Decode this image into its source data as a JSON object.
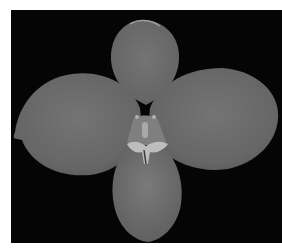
{
  "image": {
    "subject": "orchid flower",
    "style": "grayscale photograph",
    "background_color": "#050505",
    "border_color": "#ffffff",
    "petal_color": "#6b6b6b",
    "petal_highlight": "#7a7a7a",
    "column_color": "#9a9a9a"
  }
}
